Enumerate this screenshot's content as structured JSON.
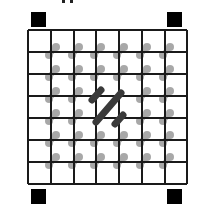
{
  "figure": {
    "background": "#ffffff",
    "grid": {
      "x_lines": [
        28,
        51,
        74,
        96,
        119,
        142,
        165,
        187
      ],
      "y_lines": [
        30,
        52,
        74,
        96,
        118,
        140,
        162,
        184
      ],
      "stroke": "#1a1a1a",
      "stroke_width": 2
    },
    "corner_markers": {
      "color": "#000000",
      "size": 15,
      "positions": [
        {
          "name": "top-left",
          "x": 31,
          "y": 12
        },
        {
          "name": "top-right",
          "x": 167,
          "y": 12
        },
        {
          "name": "bottom-left",
          "x": 31,
          "y": 189
        },
        {
          "name": "bottom-right",
          "x": 167,
          "y": 189
        }
      ]
    },
    "dumbbells": {
      "color": "#9a9a9a",
      "opacity": 0.85,
      "dot_radius": 4,
      "offset_start": [
        -2,
        3
      ],
      "offset_end": [
        5,
        -5
      ],
      "interior_x": [
        51,
        74,
        96,
        119,
        142,
        165
      ],
      "interior_y": [
        52,
        74,
        96,
        118,
        140,
        162
      ],
      "skip": [
        [
          96,
          96
        ],
        [
          119,
          96
        ],
        [
          96,
          118
        ],
        [
          119,
          118
        ]
      ]
    },
    "highlight_strokes": {
      "color": "#3a3a3a",
      "width": 7,
      "segments": [
        {
          "x1": 92,
          "y1": 100,
          "x2": 101,
          "y2": 90
        },
        {
          "x1": 96,
          "y1": 122,
          "x2": 121,
          "y2": 93
        },
        {
          "x1": 115,
          "y1": 124,
          "x2": 123,
          "y2": 115
        }
      ]
    },
    "clipped_label_fragments": [
      {
        "x": 62,
        "w": 3
      },
      {
        "x": 70,
        "w": 3
      }
    ]
  }
}
